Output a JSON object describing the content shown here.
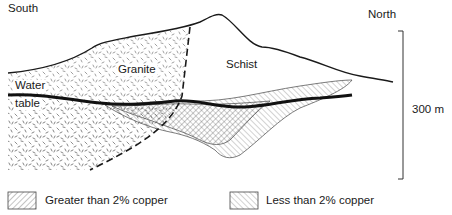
{
  "diagram": {
    "type": "geological-cross-section",
    "orientation": {
      "left": "South",
      "right": "North"
    },
    "units": [
      {
        "id": "granite",
        "label": "Granite",
        "pattern": "random-dashes"
      },
      {
        "id": "schist",
        "label": "Schist",
        "pattern": "blank"
      }
    ],
    "features": {
      "water_table_label_line1": "Water",
      "water_table_label_line2": "table",
      "contact": "dashed-line"
    },
    "scale_bar": {
      "label": "300 m"
    },
    "colors": {
      "ink": "#1a1a1a",
      "background": "#ffffff",
      "hatch": "#555555"
    }
  },
  "legend": [
    {
      "label": "Greater than 2% copper",
      "pattern": "hatch-down-right"
    },
    {
      "label": "Less than 2% copper",
      "pattern": "hatch-up-right"
    }
  ]
}
